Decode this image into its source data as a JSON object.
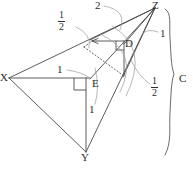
{
  "figure": {
    "stroke_color": "#4a4a4a",
    "accent_color": "#8d8d8d",
    "background": "#ffffff"
  },
  "vertices": [
    {
      "name": "X",
      "label": "X",
      "x": 7,
      "y": 78
    },
    {
      "name": "Y",
      "label": "Y",
      "x": 85,
      "y": 157
    },
    {
      "name": "Z",
      "label": "Z",
      "x": 156,
      "y": 5
    },
    {
      "name": "D",
      "label": "D",
      "x": 127,
      "y": 45
    },
    {
      "name": "E",
      "label": "E",
      "x": 94,
      "y": 85
    }
  ],
  "measures": [
    {
      "name": "edge-top-two",
      "text": "2",
      "kind": "integer",
      "x": 96,
      "y": 2
    },
    {
      "name": "edge-upper-half",
      "numerator": "1",
      "denominator": "2",
      "kind": "fraction",
      "x": 60,
      "y": 13
    },
    {
      "name": "edge-z-right-one",
      "text": "1",
      "kind": "integer",
      "x": 161,
      "y": 28
    },
    {
      "name": "edge-lower-right-half",
      "numerator": "1",
      "denominator": "2",
      "kind": "fraction",
      "x": 153,
      "y": 77
    },
    {
      "name": "edge-xe-one",
      "text": "1",
      "kind": "integer",
      "x": 58,
      "y": 65
    },
    {
      "name": "edge-ey-one",
      "text": "1",
      "kind": "integer",
      "x": 90,
      "y": 107
    }
  ],
  "brace": {
    "label": "C",
    "label_x": 181,
    "label_y": 74,
    "top_y": 8,
    "bottom_y": 156,
    "x": 168
  },
  "right_angles": [
    {
      "name": "right-angle-at-e"
    },
    {
      "name": "right-angle-at-d"
    }
  ],
  "dashed_segments": [
    {
      "name": "dashed-x-to-d"
    },
    {
      "name": "dashed-mid-to-lower"
    }
  ]
}
